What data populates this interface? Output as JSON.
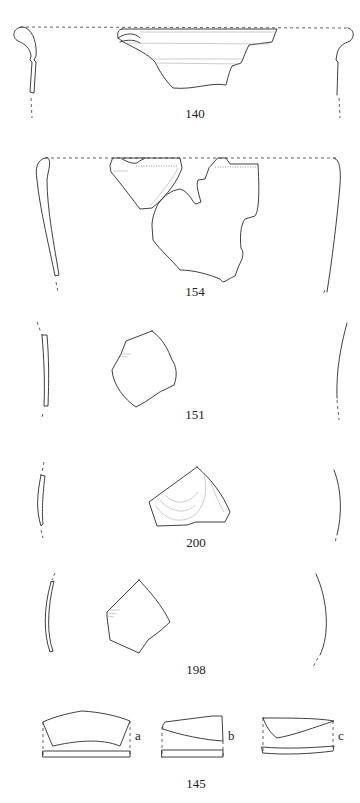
{
  "figures": [
    {
      "id": "140",
      "label": "140",
      "description": "rim sherd with profile, dashed rim line"
    },
    {
      "id": "154",
      "label": "154",
      "description": "two rim fragments with tapered profile"
    },
    {
      "id": "151",
      "label": "151",
      "description": "body sherd with thin profile"
    },
    {
      "id": "200",
      "label": "200",
      "description": "body sherd with faint surface decoration"
    },
    {
      "id": "198",
      "label": "198",
      "description": "body sherd with curved profile"
    },
    {
      "id": "145",
      "label": "145",
      "description": "three fragments a, b, c with sections",
      "parts": [
        {
          "label": "a"
        },
        {
          "label": "b"
        },
        {
          "label": "c"
        }
      ]
    }
  ],
  "colors": {
    "line": "#2a2a2a",
    "background": "#ffffff"
  }
}
